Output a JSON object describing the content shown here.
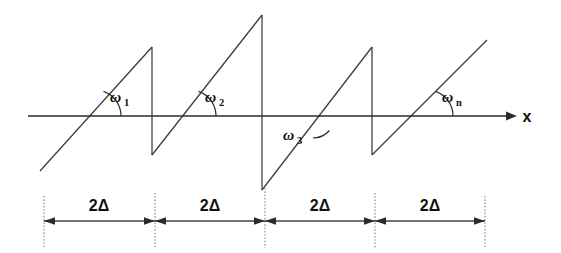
{
  "figure": {
    "kind": "sawtooth-waveform-diagram",
    "background_color": "#ffffff",
    "ink_color": "#2b2b2b",
    "guide_color": "#8a8a8a"
  },
  "axis": {
    "label": "x",
    "y_position": 116,
    "x_start": 28,
    "x_end": 513,
    "arrowhead": "right-arrow-icon"
  },
  "angles": [
    {
      "id": "w1",
      "symbol": "ω",
      "subscript": "1",
      "label": "ω₁",
      "x": 110,
      "y": 99,
      "arc_cx": 95,
      "arc_cy": 116,
      "arc_r": 26,
      "side": "above"
    },
    {
      "id": "w2",
      "symbol": "ω",
      "subscript": "2",
      "label": "ω₂",
      "x": 205,
      "y": 99,
      "arc_cx": 190,
      "arc_cy": 116,
      "arc_r": 26,
      "side": "above"
    },
    {
      "id": "w3",
      "symbol": "ω",
      "subscript": "3",
      "label": "ω₃",
      "x": 288,
      "y": 137,
      "arc_cx": 313,
      "arc_cy": 116,
      "arc_r": 22,
      "side": "below"
    },
    {
      "id": "wn",
      "symbol": "ω",
      "subscript": "n",
      "label": "ωₙ",
      "x": 442,
      "y": 99,
      "arc_cx": 427,
      "arc_cy": 116,
      "arc_r": 26,
      "side": "above"
    }
  ],
  "waveform": {
    "description": "Four rising sawtooth ramps crossing the x-axis with vertical flybacks",
    "ramps": [
      {
        "index": 1,
        "x1": 40,
        "y1": 171,
        "x2": 152,
        "y2": 47
      },
      {
        "index": 2,
        "x1": 152,
        "y1": 155,
        "x2": 262,
        "y2": 15
      },
      {
        "index": 3,
        "x1": 262,
        "y1": 190,
        "x2": 372,
        "y2": 47
      },
      {
        "index": 4,
        "x1": 372,
        "y1": 155,
        "x2": 487,
        "y2": 40
      }
    ],
    "flybacks": [
      {
        "index": 1,
        "x": 152,
        "y_top": 47,
        "y_bottom": 155
      },
      {
        "index": 2,
        "x": 262,
        "y_top": 15,
        "y_bottom": 190
      },
      {
        "index": 3,
        "x": 372,
        "y_top": 47,
        "y_bottom": 155
      }
    ]
  },
  "dimension_bar": {
    "y": 221,
    "segment_label": "2Δ",
    "label_y": 206,
    "ticks": [
      44,
      155,
      265,
      375,
      485
    ],
    "guide_top": 196,
    "guide_bottom": 248,
    "segments": [
      {
        "index": 1,
        "label": "2Δ",
        "x_start": 44,
        "x_end": 155,
        "label_x": 99
      },
      {
        "index": 2,
        "label": "2Δ",
        "x_start": 155,
        "x_end": 265,
        "label_x": 210
      },
      {
        "index": 3,
        "label": "2Δ",
        "x_start": 265,
        "x_end": 375,
        "label_x": 320
      },
      {
        "index": 4,
        "label": "2Δ",
        "x_start": 375,
        "x_end": 485,
        "label_x": 430
      }
    ]
  }
}
